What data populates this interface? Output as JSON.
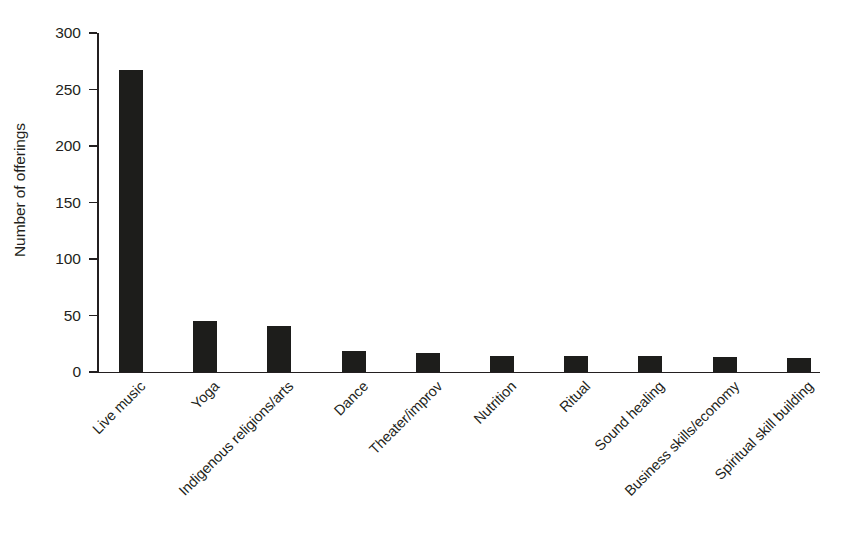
{
  "chart_data": {
    "type": "bar",
    "title": "",
    "xlabel": "",
    "ylabel": "Number of offerings",
    "ylim": [
      0,
      300
    ],
    "yticks": [
      0,
      50,
      100,
      150,
      200,
      250,
      300
    ],
    "ytick_labels": [
      "0",
      "50",
      "100",
      "150",
      "200",
      "250",
      "300"
    ],
    "grid": false,
    "legend": null,
    "bar_color": "#1d1d1b",
    "categories": [
      "Live music",
      "Yoga",
      "Indigenous religions/arts",
      "Dance",
      "Theater/improv",
      "Nutrition",
      "Ritual",
      "Sound healing",
      "Business skills/economy",
      "Spiritual skill building"
    ],
    "values": [
      267,
      45,
      41,
      19,
      17,
      14,
      14,
      14,
      13,
      12
    ]
  }
}
